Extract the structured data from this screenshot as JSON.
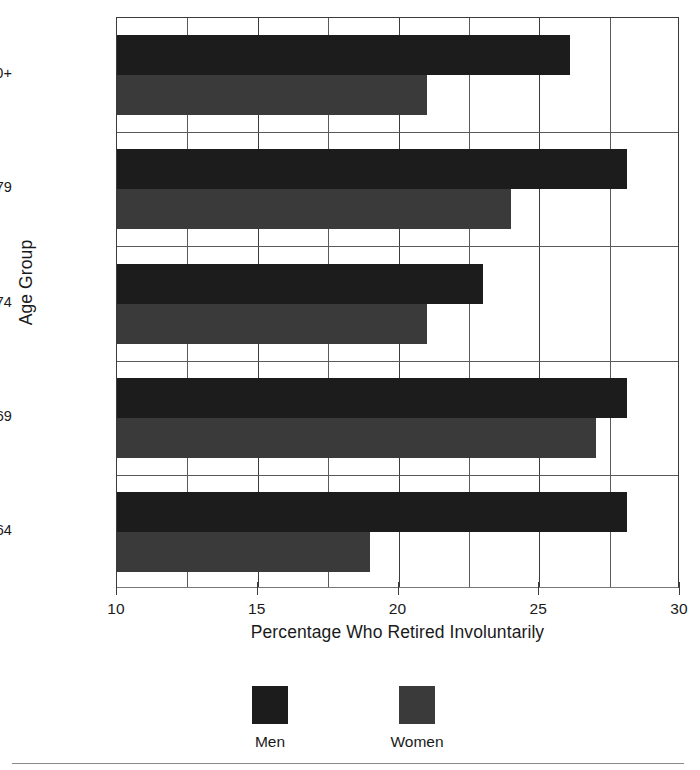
{
  "chart_data": {
    "type": "bar",
    "orientation": "horizontal",
    "title": "",
    "xlabel": "Percentage Who Retired Involuntarily",
    "ylabel": "Age Group",
    "categories": [
      "Age 60-64",
      "Age 65-69",
      "Age 70-74",
      "Age 75-79",
      "Age 80+"
    ],
    "series": [
      {
        "name": "Men",
        "values": [
          28.1,
          28.1,
          23.0,
          28.1,
          26.1
        ],
        "color": "#1c1c1c"
      },
      {
        "name": "Women",
        "values": [
          19.0,
          27.0,
          21.0,
          24.0,
          21.0
        ],
        "color": "#3a3a3a"
      }
    ],
    "xlim": [
      10,
      30
    ],
    "xticks": [
      10,
      15,
      20,
      25,
      30
    ],
    "xtick_labels": [
      "10",
      "15",
      "20",
      "25",
      "30"
    ],
    "minor_gridlines": [
      12.5,
      17.5,
      22.5,
      27.5
    ],
    "grid": true,
    "legend_position": "bottom"
  },
  "axis": {
    "x_title": "Percentage Who Retired Involuntarily",
    "y_title": "Age Group",
    "tick_10": "10",
    "tick_15": "15",
    "tick_20": "20",
    "tick_25": "25",
    "tick_30": "30"
  },
  "categories": {
    "c0": "Age 60-64",
    "c1": "Age 65-69",
    "c2": "Age 70-74",
    "c3": "Age 75-79",
    "c4": "Age 80+"
  },
  "legend": {
    "men_label": "Men",
    "women_label": "Women"
  },
  "colors": {
    "men": "#1c1c1c",
    "women": "#3a3a3a",
    "axis": "#3b3b3b",
    "grid": "#5a5a5a",
    "background": "#ffffff"
  }
}
